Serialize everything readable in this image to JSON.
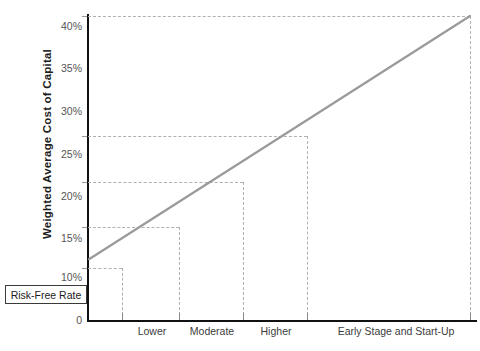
{
  "chart_data": {
    "type": "line",
    "title": "",
    "xlabel": "",
    "ylabel": "Weighted Average Cost of Capital",
    "ylim": [
      0,
      42
    ],
    "xlim": [
      0,
      100
    ],
    "grid": "dashed-guides",
    "legend": "none",
    "categories": [
      "Lower",
      "Moderate",
      "Higher",
      "Early Stage and Start-Up"
    ],
    "y_ticks": [
      "0",
      "10%",
      "15%",
      "20%",
      "25%",
      "30%",
      "35%",
      "40%"
    ],
    "y_tick_values": [
      0,
      10,
      15,
      20,
      25,
      30,
      35,
      40
    ],
    "series": [
      {
        "name": "Weighted Average Cost of Capital",
        "color": "#9a9a9a",
        "x": [
          0,
          9,
          24,
          41,
          58,
          100
        ],
        "values": [
          8,
          11,
          15.5,
          21,
          27,
          40
        ]
      }
    ],
    "guides": {
      "horizontal_values": [
        11,
        15.5,
        21,
        27,
        40
      ],
      "vertical_category_x": [
        9,
        24,
        41,
        58,
        100
      ]
    },
    "annotations": [
      {
        "name": "risk-free-rate",
        "label": "Risk-Free Rate",
        "value": 8,
        "position": "y-axis-intercept"
      }
    ]
  },
  "axis": {
    "y_title": "Weighted Average Cost of Capital",
    "ticks": [
      {
        "label": "40%",
        "value": 40
      },
      {
        "label": "35%",
        "value": 35
      },
      {
        "label": "30%",
        "value": 30
      },
      {
        "label": "25%",
        "value": 25
      },
      {
        "label": "20%",
        "value": 20
      },
      {
        "label": "15%",
        "value": 15
      },
      {
        "label": "10%",
        "value": 10
      },
      {
        "label": "0",
        "value": 0
      }
    ],
    "categories": [
      {
        "label": "Lower"
      },
      {
        "label": "Moderate"
      },
      {
        "label": "Higher"
      },
      {
        "label": "Early Stage and Start-Up"
      }
    ]
  },
  "callout": {
    "risk_free_rate_label": "Risk-Free Rate"
  },
  "colors": {
    "series_line": "#9a9a9a",
    "axis": "#111111",
    "gridline": "#b0b0b0",
    "tick_text": "#555555",
    "title_text": "#1c1c1c",
    "background": "#ffffff"
  }
}
